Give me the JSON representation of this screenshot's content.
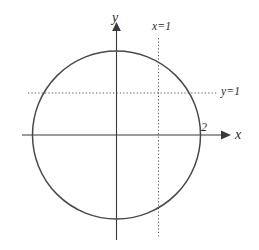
{
  "figure": {
    "background_color": "#ffffff",
    "stroke_color": "#4a4a4a",
    "width": 259,
    "height": 250
  },
  "labels": {
    "axis_x": "x",
    "axis_y": "y",
    "guide_vertical": "x=1",
    "guide_horizontal": "y=1",
    "x_intercept": "2"
  },
  "chart_data": {
    "type": "scatter",
    "title": "",
    "xlabel": "x",
    "ylabel": "y",
    "grid": false,
    "legend": null,
    "axes": {
      "x_axis": {
        "label": "x",
        "arrow": "right",
        "pixel_y": 135,
        "pixel_x_start": 22,
        "pixel_x_end": 228
      },
      "y_axis": {
        "label": "y",
        "arrow": "up",
        "pixel_x": 116.5,
        "pixel_y_start": 24,
        "pixel_y_end": 240
      }
    },
    "shapes": [
      {
        "kind": "circle",
        "equation": "(x-1)^2 + (y-1)^2 = 1",
        "center_data": [
          1,
          1
        ],
        "radius_data": 1,
        "center_pixel": [
          116.5,
          135.0
        ],
        "radius_pixel": 84.0,
        "stroke": "#4a4a4a",
        "fill": "none"
      }
    ],
    "guides": [
      {
        "kind": "vline",
        "label": "x=1",
        "value_data": 1,
        "pixel_x": 158.5,
        "pixel_y_start": 38,
        "pixel_y_end": 238,
        "style": "dotted"
      },
      {
        "kind": "hline",
        "label": "y=1",
        "value_data": 1,
        "pixel_y": 93.0,
        "pixel_x_start": 28,
        "pixel_x_end": 218,
        "style": "dotted"
      }
    ],
    "annotations": [
      {
        "text": "2",
        "describes": "x-intercept of circle at right",
        "data_point": [
          2,
          0
        ],
        "pixel": [
          201,
          127
        ]
      }
    ],
    "ticks": {
      "x": [
        2
      ],
      "y": []
    }
  }
}
